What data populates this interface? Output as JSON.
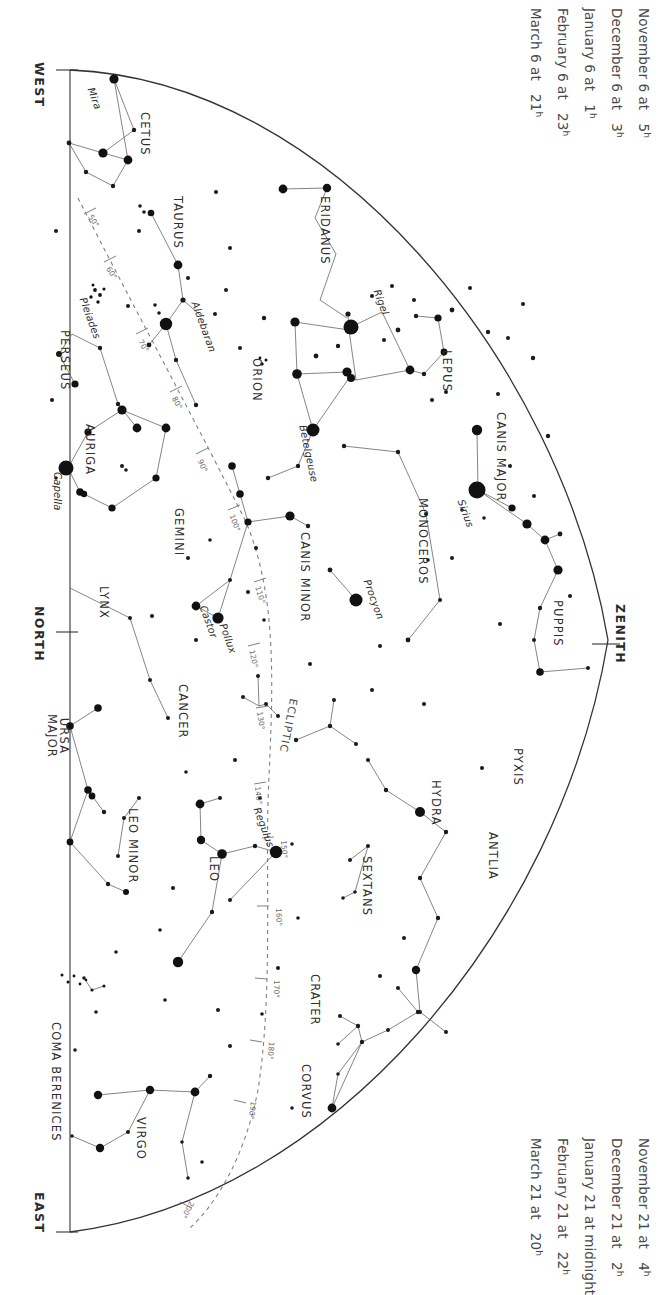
{
  "chart_data": {
    "type": "scatter",
    "projection": "half-dome sky chart, western horizon arc",
    "grid": false,
    "legend_position": "none",
    "xlabel": "",
    "ylabel": "",
    "annotations": [
      "Ecliptic drawn as dashed curve with degree ticks from 50 to 200 degrees",
      "Zenith marked on right edge; compass points WEST, NORTH, EAST on left edge"
    ],
    "categories": [
      "CETUS",
      "TAURUS",
      "ERIDANUS",
      "PERSEUS",
      "AURIGA",
      "ORION",
      "LEPUS",
      "CANIS MAJOR",
      "MONOCEROS",
      "GEMINI",
      "CANIS MINOR",
      "LYNX",
      "CANCER",
      "PUPPIS",
      "PYXIS",
      "ANTLIA",
      "URSA MAJOR",
      "LEO MINOR",
      "LEO",
      "HYDRA",
      "SEXTANS",
      "CRATER",
      "CORVUS",
      "COMA BERENICES",
      "VIRGO"
    ],
    "values": [
      25,
      18,
      22,
      14,
      12,
      20,
      8,
      16,
      10,
      14,
      6,
      9,
      7,
      11,
      5,
      4,
      15,
      6,
      13,
      19,
      5,
      7,
      6,
      8,
      12
    ],
    "series": [
      {
        "name": "named bright stars",
        "points": [
          {
            "label": "Mira",
            "constellation": "CETUS",
            "magnitude_class": "bright"
          },
          {
            "label": "Aldebaran",
            "constellation": "TAURUS",
            "magnitude_class": "very-bright"
          },
          {
            "label": "Capella",
            "constellation": "AURIGA",
            "magnitude_class": "very-bright"
          },
          {
            "label": "Rigel",
            "constellation": "ORION",
            "magnitude_class": "very-bright"
          },
          {
            "label": "Betelgeuse",
            "constellation": "ORION",
            "magnitude_class": "very-bright"
          },
          {
            "label": "Sirius",
            "constellation": "CANIS MAJOR",
            "magnitude_class": "brightest"
          },
          {
            "label": "Procyon",
            "constellation": "CANIS MINOR",
            "magnitude_class": "very-bright"
          },
          {
            "label": "Castor",
            "constellation": "GEMINI",
            "magnitude_class": "bright"
          },
          {
            "label": "Pollux",
            "constellation": "GEMINI",
            "magnitude_class": "very-bright"
          },
          {
            "label": "Regulus",
            "constellation": "LEO",
            "magnitude_class": "very-bright"
          },
          {
            "label": "Pleiades",
            "constellation": "TAURUS",
            "magnitude_class": "cluster"
          }
        ]
      }
    ],
    "ecliptic_ticks": [
      "50°",
      "60°",
      "70°",
      "80°",
      "90°",
      "100°",
      "110°",
      "120°",
      "130°",
      "140°",
      "150°",
      "160°",
      "170°",
      "180°",
      "190°",
      "200°"
    ],
    "ecliptic_label": "ECLIPTIC"
  },
  "edge_labels": {
    "west": "WEST",
    "north": "NORTH",
    "east": "EAST",
    "zenith": "ZENITH"
  },
  "caption_top": {
    "lines": [
      {
        "date": "November 6 at",
        "hour": "5",
        "unit": "h"
      },
      {
        "date": "December 6 at",
        "hour": "3",
        "unit": "h"
      },
      {
        "date": "January 6 at",
        "hour": "1",
        "unit": "h"
      },
      {
        "date": "February 6 at",
        "hour": "23",
        "unit": "h"
      },
      {
        "date": "March 6 at",
        "hour": "21",
        "unit": "h"
      }
    ]
  },
  "caption_bottom": {
    "lines": [
      {
        "date": "November 21 at",
        "hour": "4",
        "unit": "h"
      },
      {
        "date": "December 21 at",
        "hour": "2",
        "unit": "h"
      },
      {
        "date": "January 21 at midnight",
        "hour": "",
        "unit": ""
      },
      {
        "date": "February 21 at",
        "hour": "22",
        "unit": "h"
      },
      {
        "date": "March 21 at",
        "hour": "20",
        "unit": "h"
      }
    ]
  },
  "constellations": [
    {
      "name": "CETUS",
      "x": 152,
      "y": 112,
      "rot": 90
    },
    {
      "name": "TAURUS",
      "x": 185,
      "y": 196,
      "rot": 90
    },
    {
      "name": "ERIDANUS",
      "x": 332,
      "y": 196,
      "rot": 90
    },
    {
      "name": "PERSEUS",
      "x": 72,
      "y": 330,
      "rot": 90
    },
    {
      "name": "AURIGA",
      "x": 97,
      "y": 424,
      "rot": 90
    },
    {
      "name": "ORION",
      "x": 264,
      "y": 358,
      "rot": 90
    },
    {
      "name": "LEPUS",
      "x": 454,
      "y": 350,
      "rot": 90
    },
    {
      "name": "CANIS MAJOR",
      "x": 508,
      "y": 412,
      "rot": 90
    },
    {
      "name": "MONOCEROS",
      "x": 430,
      "y": 498,
      "rot": 90
    },
    {
      "name": "GEMINI",
      "x": 186,
      "y": 508,
      "rot": 90
    },
    {
      "name": "CANIS MINOR",
      "x": 312,
      "y": 532,
      "rot": 90
    },
    {
      "name": "LYNX",
      "x": 111,
      "y": 586,
      "rot": 90
    },
    {
      "name": "CANCER",
      "x": 190,
      "y": 684,
      "rot": 90
    },
    {
      "name": "PUPPIS",
      "x": 565,
      "y": 600,
      "rot": 90
    },
    {
      "name": "PYXIS",
      "x": 525,
      "y": 748,
      "rot": 90
    },
    {
      "name": "ANTLIA",
      "x": 500,
      "y": 832,
      "rot": 90
    },
    {
      "name": "LEO MINOR",
      "x": 140,
      "y": 808,
      "rot": 90
    },
    {
      "name": "LEO",
      "x": 221,
      "y": 856,
      "rot": 90
    },
    {
      "name": "HYDRA",
      "x": 443,
      "y": 780,
      "rot": 90
    },
    {
      "name": "SEXTANS",
      "x": 374,
      "y": 856,
      "rot": 90
    },
    {
      "name": "CRATER",
      "x": 322,
      "y": 974,
      "rot": 90
    },
    {
      "name": "CORVUS",
      "x": 313,
      "y": 1064,
      "rot": 90
    },
    {
      "name": "COMA BERENICES",
      "x": 63,
      "y": 1022,
      "rot": 90
    },
    {
      "name": "VIRGO",
      "x": 148,
      "y": 1117,
      "rot": 90
    }
  ],
  "constellations_two_line": [
    {
      "line1": "URSA",
      "line2": "MAJOR",
      "x": 70,
      "y": 714,
      "rot": 90
    }
  ],
  "star_names": [
    {
      "name": "Mira",
      "x": 96,
      "y": 86,
      "rot": 70
    },
    {
      "name": "Aldebaran",
      "x": 200,
      "y": 300,
      "rot": 70
    },
    {
      "name": "Pleiades",
      "x": 88,
      "y": 296,
      "rot": 70
    },
    {
      "name": "Capella",
      "x": 63,
      "y": 472,
      "rot": 90
    },
    {
      "name": "Rigel",
      "x": 382,
      "y": 288,
      "rot": 70
    },
    {
      "name": "Betelgeuse",
      "x": 308,
      "y": 424,
      "rot": 78
    },
    {
      "name": "Sirius",
      "x": 466,
      "y": 498,
      "rot": 70
    },
    {
      "name": "Procyon",
      "x": 372,
      "y": 578,
      "rot": 70
    },
    {
      "name": "Castor",
      "x": 208,
      "y": 604,
      "rot": 70
    },
    {
      "name": "Pollux",
      "x": 228,
      "y": 622,
      "rot": 70
    },
    {
      "name": "Regulus",
      "x": 262,
      "y": 806,
      "rot": 70
    }
  ],
  "ecliptic": {
    "label": "ECLIPTIC",
    "label_x": 300,
    "label_y": 700,
    "ticks": [
      {
        "deg": "50°",
        "x": 94,
        "y": 213,
        "rot": 58
      },
      {
        "deg": "60°",
        "x": 112,
        "y": 265,
        "rot": 58
      },
      {
        "deg": "70°",
        "x": 144,
        "y": 338,
        "rot": 60
      },
      {
        "deg": "80°",
        "x": 178,
        "y": 395,
        "rot": 62
      },
      {
        "deg": "90°",
        "x": 204,
        "y": 458,
        "rot": 66
      },
      {
        "deg": "100°",
        "x": 236,
        "y": 513,
        "rot": 70
      },
      {
        "deg": "110°",
        "x": 262,
        "y": 585,
        "rot": 74
      },
      {
        "deg": "120°",
        "x": 256,
        "y": 649,
        "rot": 78
      },
      {
        "deg": "130°",
        "x": 264,
        "y": 711,
        "rot": 82
      },
      {
        "deg": "140°",
        "x": 262,
        "y": 786,
        "rot": 84
      },
      {
        "deg": "150°",
        "x": 288,
        "y": 840,
        "rot": 86
      },
      {
        "deg": "160°",
        "x": 283,
        "y": 908,
        "rot": 88
      },
      {
        "deg": "170°",
        "x": 281,
        "y": 980,
        "rot": 90
      },
      {
        "deg": "180°",
        "x": 276,
        "y": 1042,
        "rot": 94
      },
      {
        "deg": "190°",
        "x": 258,
        "y": 1102,
        "rot": 98
      },
      {
        "deg": "200°",
        "x": 196,
        "y": 1204,
        "rot": 118
      }
    ]
  },
  "colors": {
    "star": "#111111",
    "line": "#555555",
    "horizon": "#333333",
    "ecliptic": "#777777",
    "text": "#2e2e2e",
    "caption": "#4a4a4a",
    "background": "#ffffff"
  }
}
